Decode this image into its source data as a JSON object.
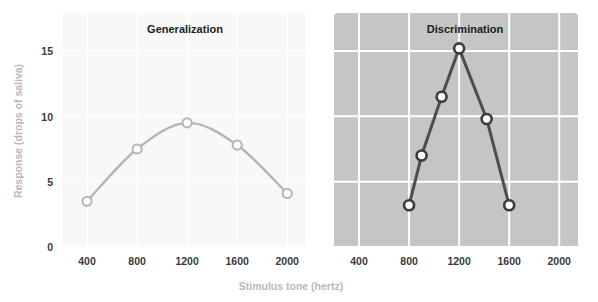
{
  "figure": {
    "width": 598,
    "height": 302,
    "background": "#ffffff"
  },
  "axes": {
    "y_title": "Response (drops of saliva)",
    "x_title": "Stimulus tone (hertz)",
    "y_ticks": [
      "0",
      "5",
      "10",
      "15"
    ],
    "x_ticks": [
      "400",
      "800",
      "1200",
      "1600",
      "2000"
    ],
    "y_tick_label_0": "0",
    "y_tick_label_5": "5",
    "y_tick_label_10": "10",
    "y_tick_label_15": "15",
    "x_tick_label_400": "400",
    "x_tick_label_800": "800",
    "x_tick_label_1200": "1200",
    "x_tick_label_1600": "1600",
    "x_tick_label_2000": "2000"
  },
  "panels": {
    "left": {
      "title": "Generalization",
      "background": "#f8f8f8",
      "gridline_color": "#ffffff",
      "line_color": "#b5b5b5",
      "marker_stroke": "#b5b5b5",
      "marker_fill": "#ffffff",
      "x_ticks": [
        "400",
        "800",
        "1200",
        "1600",
        "2000"
      ]
    },
    "right": {
      "title": "Discrimination",
      "background": "#c5c5c5",
      "gridline_color": "#ffffff",
      "line_color": "#4d4d4d",
      "marker_stroke": "#3b3b3b",
      "marker_fill": "#ffffff",
      "x_ticks": [
        "400",
        "800",
        "1200",
        "1600",
        "2000"
      ]
    }
  },
  "chart_data": [
    {
      "type": "line",
      "title": "Generalization",
      "xlabel": "Stimulus tone (hertz)",
      "ylabel": "Response (drops of saliva)",
      "xlim": [
        200,
        2150
      ],
      "ylim": [
        0,
        16
      ],
      "xticks": [
        400,
        800,
        1200,
        1600,
        2000
      ],
      "yticks": [
        0,
        5,
        10,
        15
      ],
      "grid": true,
      "legend": "none",
      "series": [
        {
          "name": "Generalization",
          "x": [
            400,
            800,
            1200,
            1600,
            2000
          ],
          "values": [
            3.5,
            7.5,
            9.5,
            7.8,
            4.1
          ],
          "color": "#b5b5b5",
          "marker": "open-circle",
          "smooth": true
        }
      ]
    },
    {
      "type": "line",
      "title": "Discrimination",
      "xlabel": "Stimulus tone (hertz)",
      "ylabel": "Response (drops of saliva)",
      "xlim": [
        200,
        2150
      ],
      "ylim": [
        0,
        16
      ],
      "xticks": [
        400,
        800,
        1200,
        1600,
        2000
      ],
      "yticks": [
        0,
        5,
        10,
        15
      ],
      "grid": true,
      "legend": "none",
      "series": [
        {
          "name": "Discrimination",
          "x": [
            800,
            900,
            1060,
            1200,
            1420,
            1600
          ],
          "values": [
            3.2,
            7.0,
            11.5,
            15.2,
            9.8,
            3.2
          ],
          "color": "#4d4d4d",
          "marker": "open-circle",
          "smooth": false
        }
      ]
    }
  ]
}
